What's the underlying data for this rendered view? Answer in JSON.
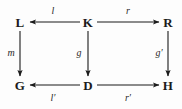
{
  "diagram": {
    "type": "commutative-diagram",
    "background_color": "#fdfdfd",
    "ink_color": "#1b1b1b",
    "nodes": [
      {
        "id": "L",
        "label": "L",
        "x": 20,
        "y": 22
      },
      {
        "id": "K",
        "label": "K",
        "x": 88,
        "y": 22
      },
      {
        "id": "R",
        "label": "R",
        "x": 168,
        "y": 22
      },
      {
        "id": "G",
        "label": "G",
        "x": 20,
        "y": 85
      },
      {
        "id": "D",
        "label": "D",
        "x": 88,
        "y": 85
      },
      {
        "id": "H",
        "label": "H",
        "x": 168,
        "y": 85
      }
    ],
    "edges": [
      {
        "id": "l",
        "label": "l",
        "from": "K",
        "to": "L",
        "direction": "left",
        "label_x": 53,
        "label_y": 11
      },
      {
        "id": "r",
        "label": "r",
        "from": "K",
        "to": "R",
        "direction": "right",
        "label_x": 128,
        "label_y": 11
      },
      {
        "id": "m",
        "label": "m",
        "from": "L",
        "to": "G",
        "direction": "down",
        "label_x": 11,
        "label_y": 53
      },
      {
        "id": "g",
        "label": "g",
        "from": "K",
        "to": "D",
        "direction": "down",
        "label_x": 79,
        "label_y": 53
      },
      {
        "id": "gp",
        "label": "g′",
        "from": "R",
        "to": "H",
        "direction": "down",
        "label_x": 159,
        "label_y": 53
      },
      {
        "id": "lp",
        "label": "l′",
        "from": "D",
        "to": "G",
        "direction": "left",
        "label_x": 53,
        "label_y": 98
      },
      {
        "id": "rp",
        "label": "r′",
        "from": "D",
        "to": "H",
        "direction": "right",
        "label_x": 128,
        "label_y": 98
      }
    ]
  }
}
